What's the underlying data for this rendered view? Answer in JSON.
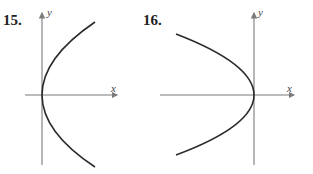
{
  "panels": [
    {
      "number": "15.",
      "x_axis_label": "x",
      "y_axis_label": "y",
      "curve": "parabola opening right, vertex at origin"
    },
    {
      "number": "16.",
      "x_axis_label": "x",
      "y_axis_label": "y",
      "curve": "parabola opening left, vertex at origin"
    }
  ],
  "colors": {
    "axis": "#7a7a7a",
    "curve": "#2a2a2a"
  }
}
